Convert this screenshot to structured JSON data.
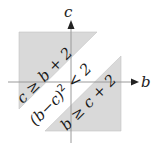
{
  "diagram": {
    "type": "region-plot",
    "axes": {
      "horizontal": {
        "label": "b"
      },
      "vertical": {
        "label": "c"
      }
    },
    "regions": [
      {
        "id": "upper",
        "label": "c ≥ b + 2",
        "fill": "#d9d9d9"
      },
      {
        "id": "middle",
        "label_base": "(b−c)",
        "label_exp": "2",
        "label_rest": " < 2",
        "fill": "#ffffff"
      },
      {
        "id": "lower",
        "label": "b ≥ c + 2",
        "fill": "#d9d9d9"
      }
    ]
  }
}
